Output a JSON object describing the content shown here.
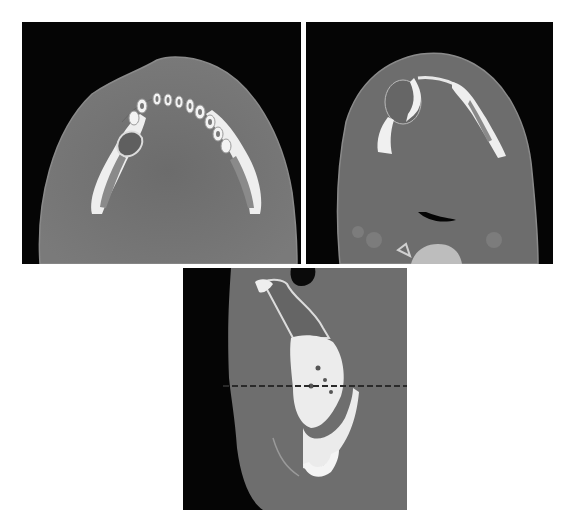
{
  "figure": {
    "panels": [
      {
        "id": "axial-mandible-teeth",
        "view": "axial CT",
        "region": "mandible with dental arch"
      },
      {
        "id": "axial-mandible-lower",
        "view": "axial CT",
        "region": "mandible with cystic lesion and airway"
      },
      {
        "id": "coronal-mandible",
        "view": "coronal CT",
        "region": "mandible and maxilla with lesion"
      }
    ],
    "colors": {
      "background": "#ffffff",
      "air": "#050505",
      "soft_tissue": "#6f6f6f",
      "bone": "#f2f2f2"
    }
  }
}
